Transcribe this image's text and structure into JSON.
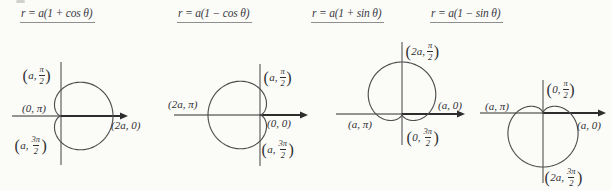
{
  "figure": {
    "background": "#fbfbf8",
    "ink": "#2f2f33",
    "axis_color": "#2d2d2d",
    "curve_color": "#4e4e4e",
    "title_color": "#3a3a42",
    "underline_color": "#8f8f8f"
  },
  "chart_data": [
    {
      "type": "line",
      "curve": "cardioid",
      "title": "r = a(1 + cos θ)",
      "polar": {
        "equation": "r = a(1 + cos θ)",
        "trig": "cos",
        "sign": 1,
        "orientation": "opens-right"
      },
      "key_points": [
        {
          "r": "a",
          "theta": "π/2"
        },
        {
          "r": "0",
          "theta": "π"
        },
        {
          "r": "2a",
          "theta": "0"
        },
        {
          "r": "a",
          "theta": "3π/2"
        }
      ],
      "layout": {
        "title_x": 20,
        "title_y": 7,
        "origin_x": 61,
        "origin_y": 116,
        "a_px": 26,
        "h_axis": [
          12,
          128
        ],
        "v_axis": [
          62,
          165
        ]
      },
      "labels": [
        {
          "pre": "a,",
          "num": "π",
          "den": "2",
          "x": 22,
          "y": 65
        },
        {
          "text": "(0, π)",
          "x": 22,
          "y": 102
        },
        {
          "text": "(2a, 0)",
          "x": 111,
          "y": 119
        },
        {
          "pre": "a,",
          "num": "3π",
          "den": "2",
          "x": 14,
          "y": 135
        }
      ]
    },
    {
      "type": "line",
      "curve": "cardioid",
      "title": "r = a(1 − cos θ)",
      "polar": {
        "equation": "r = a(1 − cos θ)",
        "trig": "cos",
        "sign": -1,
        "orientation": "opens-left"
      },
      "key_points": [
        {
          "r": "a",
          "theta": "π/2"
        },
        {
          "r": "2a",
          "theta": "π"
        },
        {
          "r": "0",
          "theta": "0"
        },
        {
          "r": "a",
          "theta": "3π/2"
        }
      ],
      "layout": {
        "title_x": 177,
        "title_y": 7,
        "origin_x": 260,
        "origin_y": 115,
        "a_px": 26,
        "h_axis": [
          174,
          308
        ],
        "v_axis": [
          64,
          166
        ]
      },
      "labels": [
        {
          "text": "(2a, π)",
          "x": 168,
          "y": 98
        },
        {
          "pre": "a,",
          "num": "π",
          "den": "2",
          "x": 263,
          "y": 67
        },
        {
          "text": "(0, 0)",
          "x": 267,
          "y": 117
        },
        {
          "pre": "a,",
          "num": "3π",
          "den": "2",
          "x": 261,
          "y": 139
        }
      ]
    },
    {
      "type": "line",
      "curve": "cardioid",
      "title": "r = a(1 + sin θ)",
      "polar": {
        "equation": "r = a(1 + sin θ)",
        "trig": "sin",
        "sign": 1,
        "orientation": "opens-up"
      },
      "key_points": [
        {
          "r": "2a",
          "theta": "π/2"
        },
        {
          "r": "a",
          "theta": "0"
        },
        {
          "r": "a",
          "theta": "π"
        },
        {
          "r": "0",
          "theta": "3π/2"
        }
      ],
      "layout": {
        "title_x": 311,
        "title_y": 7,
        "origin_x": 402,
        "origin_y": 114,
        "a_px": 26,
        "h_axis": [
          336,
          465
        ],
        "v_axis": [
          42,
          145
        ]
      },
      "labels": [
        {
          "pre": "2a,",
          "num": "π",
          "den": "2",
          "x": 405,
          "y": 41
        },
        {
          "text": "(a, 0)",
          "x": 438,
          "y": 99
        },
        {
          "text": "(a, π)",
          "x": 348,
          "y": 118
        },
        {
          "pre": "0,",
          "num": "3π",
          "den": "2",
          "x": 406,
          "y": 127
        }
      ]
    },
    {
      "type": "line",
      "curve": "cardioid",
      "title": "r = a(1 − sin θ)",
      "polar": {
        "equation": "r = a(1 − sin θ)",
        "trig": "sin",
        "sign": -1,
        "orientation": "opens-down"
      },
      "key_points": [
        {
          "r": "0",
          "theta": "π/2"
        },
        {
          "r": "a",
          "theta": "π"
        },
        {
          "r": "a",
          "theta": "0"
        },
        {
          "r": "2a",
          "theta": "3π/2"
        }
      ],
      "layout": {
        "title_x": 430,
        "title_y": 7,
        "origin_x": 543,
        "origin_y": 113,
        "a_px": 27,
        "h_axis": [
          480,
          606
        ],
        "v_axis": [
          80,
          183
        ]
      },
      "labels": [
        {
          "pre": "0,",
          "num": "π",
          "den": "2",
          "x": 546,
          "y": 79
        },
        {
          "text": "(a, π)",
          "x": 485,
          "y": 100
        },
        {
          "text": "(a, 0)",
          "x": 577,
          "y": 119
        },
        {
          "pre": "2a,",
          "num": "3π",
          "den": "2",
          "x": 544,
          "y": 167
        }
      ]
    }
  ]
}
